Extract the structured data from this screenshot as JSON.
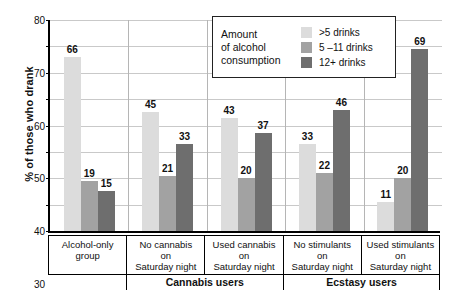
{
  "chart_data": {
    "type": "bar",
    "title": "",
    "xlabel": "",
    "ylabel": "% of those who drank",
    "ylim": [
      0,
      80
    ],
    "yticks": [
      0,
      10,
      20,
      30,
      40,
      50,
      60,
      70,
      80
    ],
    "grid": true,
    "legend_position": "top-right",
    "legend_title": "Amount of alcohol consumption",
    "categories": [
      "Alcohol-only\ngroup",
      "No cannabis\non\nSaturday night",
      "Used cannabis\non\nSaturday night",
      "No stimulants\non\nSaturday night",
      "Used stimulants\non\nSaturday night"
    ],
    "supergroups": [
      {
        "label": "Cannabis users",
        "categories": [
          1,
          2
        ]
      },
      {
        "label": "Ecstasy users",
        "categories": [
          3,
          4
        ]
      }
    ],
    "series": [
      {
        "name": ">5 drinks",
        "color": "#dcdcdc",
        "values": [
          66,
          45,
          43,
          33,
          11
        ]
      },
      {
        "name": "5 –11 drinks",
        "color": "#a2a2a2",
        "values": [
          19,
          21,
          20,
          22,
          20
        ]
      },
      {
        "name": "12+ drinks",
        "color": "#6e6e6e",
        "values": [
          15,
          33,
          37,
          46,
          69
        ]
      }
    ]
  },
  "legend": {
    "title_lines": [
      "Amount",
      "of alcohol",
      "consumption"
    ],
    "entries": [
      {
        "label": ">5 drinks",
        "color": "#dcdcdc"
      },
      {
        "label": "5 –11 drinks",
        "color": "#a2a2a2"
      },
      {
        "label": "12+ drinks",
        "color": "#6e6e6e"
      }
    ]
  },
  "axis": {
    "y_title": "% of those who drank",
    "y_labels": [
      "80",
      "70",
      "60",
      "50",
      "40",
      "30",
      "20",
      "10",
      "0"
    ]
  }
}
